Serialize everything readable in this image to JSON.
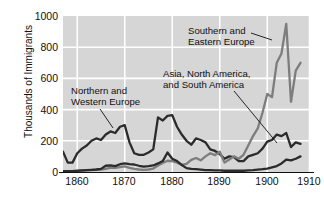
{
  "chart_data": {
    "type": "line",
    "title": "",
    "xlabel": "",
    "ylabel": "Thousands of Immigrants",
    "xlim": [
      1860,
      1912
    ],
    "ylim": [
      0,
      1000
    ],
    "grid": true,
    "legend_position": "inline-annotations",
    "xticks": [
      "1860",
      "1870",
      "1880",
      "1890",
      "1900",
      "1910"
    ],
    "xtick_values": [
      1860,
      1870,
      1880,
      1890,
      1900,
      1910
    ],
    "yticks": [
      "0",
      "200",
      "400",
      "600",
      "800",
      "1000"
    ],
    "ytick_values": [
      0,
      200,
      400,
      600,
      800,
      1000
    ],
    "annotations": [
      {
        "text_line1": "Southern and",
        "text_line2": "Eastern Europe",
        "series": "Southern and Eastern Europe"
      },
      {
        "text_line1": "Asia, North America,",
        "text_line2": "and South America",
        "series": "Asia, North America, and South America"
      },
      {
        "text_line1": "Northern and",
        "text_line2": "Western Europe",
        "series": "Northern and Western Europe"
      }
    ],
    "series": [
      {
        "name": "Northern and Western Europe",
        "color": "#2b2b2b",
        "x": [
          1860,
          1861,
          1862,
          1863,
          1864,
          1865,
          1866,
          1867,
          1868,
          1869,
          1870,
          1871,
          1872,
          1873,
          1874,
          1875,
          1876,
          1877,
          1878,
          1879,
          1880,
          1881,
          1882,
          1883,
          1884,
          1885,
          1886,
          1887,
          1888,
          1889,
          1890,
          1891,
          1892,
          1893,
          1894,
          1895,
          1896,
          1897,
          1898,
          1899,
          1900,
          1901,
          1902,
          1903,
          1904,
          1905,
          1906,
          1907,
          1908,
          1909,
          1910
        ],
        "values": [
          130,
          60,
          60,
          120,
          150,
          170,
          200,
          215,
          205,
          240,
          260,
          250,
          290,
          300,
          190,
          120,
          110,
          110,
          125,
          145,
          350,
          330,
          360,
          365,
          290,
          240,
          200,
          175,
          215,
          205,
          190,
          145,
          135,
          115,
          85,
          100,
          95,
          70,
          70,
          100,
          110,
          120,
          150,
          195,
          205,
          240,
          230,
          250,
          160,
          190,
          180
        ]
      },
      {
        "name": "Southern and Eastern Europe",
        "color": "#7d7d7d",
        "x": [
          1860,
          1861,
          1862,
          1863,
          1864,
          1865,
          1866,
          1867,
          1868,
          1869,
          1870,
          1871,
          1872,
          1873,
          1874,
          1875,
          1876,
          1877,
          1878,
          1879,
          1880,
          1881,
          1882,
          1883,
          1884,
          1885,
          1886,
          1887,
          1888,
          1889,
          1890,
          1891,
          1892,
          1893,
          1894,
          1895,
          1896,
          1897,
          1898,
          1899,
          1900,
          1901,
          1902,
          1903,
          1904,
          1905,
          1906,
          1907,
          1908,
          1909,
          1910
        ],
        "values": [
          5,
          5,
          5,
          5,
          8,
          10,
          12,
          14,
          16,
          20,
          28,
          26,
          32,
          36,
          26,
          20,
          16,
          14,
          16,
          22,
          42,
          58,
          72,
          70,
          60,
          45,
          52,
          78,
          90,
          75,
          100,
          120,
          108,
          130,
          60,
          80,
          100,
          85,
          110,
          170,
          230,
          280,
          380,
          500,
          480,
          700,
          760,
          950,
          450,
          650,
          700
        ]
      },
      {
        "name": "Asia, North America, and South America",
        "color": "#2b2b2b",
        "x": [
          1860,
          1861,
          1862,
          1863,
          1864,
          1865,
          1866,
          1867,
          1868,
          1869,
          1870,
          1871,
          1872,
          1873,
          1874,
          1875,
          1876,
          1877,
          1878,
          1879,
          1880,
          1881,
          1882,
          1883,
          1884,
          1885,
          1886,
          1887,
          1888,
          1889,
          1890,
          1891,
          1892,
          1893,
          1894,
          1895,
          1896,
          1897,
          1898,
          1899,
          1900,
          1901,
          1902,
          1903,
          1904,
          1905,
          1906,
          1907,
          1908,
          1909,
          1910
        ],
        "values": [
          5,
          5,
          6,
          8,
          10,
          12,
          14,
          16,
          20,
          40,
          42,
          38,
          50,
          55,
          50,
          48,
          40,
          35,
          38,
          42,
          55,
          70,
          125,
          85,
          70,
          45,
          25,
          20,
          18,
          15,
          12,
          12,
          10,
          10,
          8,
          8,
          8,
          8,
          8,
          10,
          12,
          15,
          18,
          22,
          30,
          38,
          55,
          80,
          75,
          85,
          100
        ]
      }
    ]
  }
}
